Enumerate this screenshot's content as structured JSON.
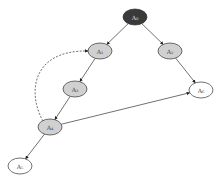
{
  "diagram": {
    "nodes": [
      {
        "id": "A0",
        "label": "A₀",
        "cx": 135,
        "cy": 17,
        "fill": "#3a3a3a",
        "dark": true
      },
      {
        "id": "A1",
        "label": "A₁",
        "cx": 100,
        "cy": 51,
        "fill": "#d0d0d0",
        "dark": false
      },
      {
        "id": "A2",
        "label": "A₂",
        "cx": 170,
        "cy": 51,
        "fill": "#d0d0d0",
        "dark": false
      },
      {
        "id": "A3",
        "label": "A₃",
        "cx": 75,
        "cy": 89,
        "fill": "#d0d0d0",
        "dark": false
      },
      {
        "id": "A4",
        "label": "A₄",
        "cx": 50,
        "cy": 127,
        "fill": "#d0d0d0",
        "dark": false
      },
      {
        "id": "A6",
        "label": "A₆",
        "cx": 201,
        "cy": 90,
        "fill": "#ffffff",
        "dark": false
      },
      {
        "id": "A5",
        "label": "A₅",
        "cx": 20,
        "cy": 166,
        "fill": "#ffffff",
        "dark": false
      }
    ],
    "edges": [
      {
        "from": "A0",
        "to": "A1",
        "style": "solid"
      },
      {
        "from": "A0",
        "to": "A2",
        "style": "solid"
      },
      {
        "from": "A1",
        "to": "A3",
        "style": "solid"
      },
      {
        "from": "A2",
        "to": "A6",
        "style": "solid"
      },
      {
        "from": "A3",
        "to": "A4",
        "style": "solid"
      },
      {
        "from": "A4",
        "to": "A6",
        "style": "solid"
      },
      {
        "from": "A4",
        "to": "A5",
        "style": "solid"
      },
      {
        "from": "A4",
        "to": "A1",
        "style": "dashed"
      }
    ]
  }
}
